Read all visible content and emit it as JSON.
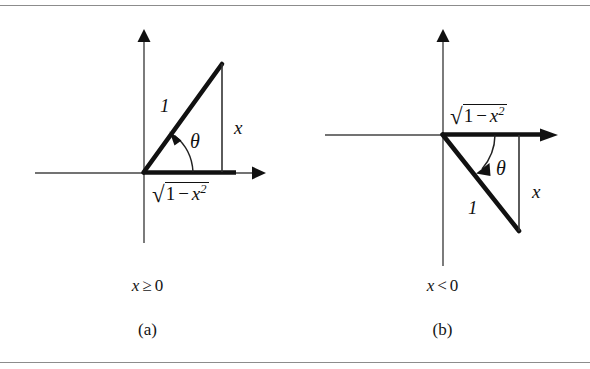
{
  "figure": {
    "background_color": "#ffffff",
    "ink_color": "#111111",
    "rule_color": "#8c8c8c",
    "panels": [
      {
        "id": "a",
        "tag": "(a)",
        "condition": "x ≥ 0",
        "condition_var": "x",
        "condition_operator": "≥",
        "condition_value": "0",
        "angle_label": "θ",
        "hypotenuse_label": "1",
        "vertical_label": "x",
        "base_label": {
          "radical": "√",
          "one": "1",
          "minus": "−",
          "variable": "x",
          "exponent": "2"
        },
        "quadrant": "first",
        "description": "right triangle above the x-axis with angle theta at the origin"
      },
      {
        "id": "b",
        "tag": "(b)",
        "condition": "x < 0",
        "condition_var": "x",
        "condition_operator": "<",
        "condition_value": "0",
        "angle_label": "θ",
        "hypotenuse_label": "1",
        "vertical_label": "x",
        "base_label": {
          "radical": "√",
          "one": "1",
          "minus": "−",
          "variable": "x",
          "exponent": "2"
        },
        "quadrant": "fourth",
        "description": "right triangle below the x-axis with angle theta at the origin"
      }
    ]
  }
}
